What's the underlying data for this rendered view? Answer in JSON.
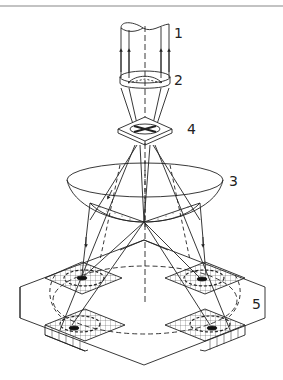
{
  "figure": {
    "type": "technical-illustration",
    "colors": {
      "line": "#222222",
      "rule": "#888888",
      "background": "#ffffff"
    }
  },
  "labels": [
    {
      "id": "1",
      "text": "1",
      "x": 174,
      "y": 26,
      "refers_to": "beam-cylinder"
    },
    {
      "id": "2",
      "text": "2",
      "x": 174,
      "y": 73,
      "refers_to": "ring-optic"
    },
    {
      "id": "4",
      "text": "4",
      "x": 187,
      "y": 122,
      "refers_to": "plate-with-cross"
    },
    {
      "id": "3",
      "text": "3",
      "x": 229,
      "y": 174,
      "refers_to": "paraboloid-mirror"
    },
    {
      "id": "5",
      "text": "5",
      "x": 252,
      "y": 297,
      "refers_to": "base-block"
    }
  ],
  "components": {
    "beam": {
      "name": "beam-cylinder"
    },
    "ring": {
      "name": "ring-optic"
    },
    "plate": {
      "name": "plate-with-cross"
    },
    "mirror": {
      "name": "paraboloid-mirror"
    },
    "base": {
      "name": "base-block"
    },
    "pads": [
      {
        "name": "detector-pad-back-left"
      },
      {
        "name": "detector-pad-back-right"
      },
      {
        "name": "detector-pad-front-left"
      },
      {
        "name": "detector-pad-front-right"
      }
    ]
  }
}
